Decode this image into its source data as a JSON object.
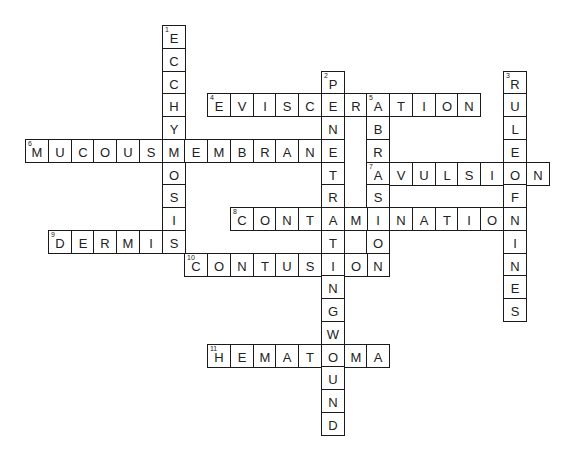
{
  "puzzle": {
    "grid": {
      "origin_x": 25,
      "origin_y": 25,
      "cell_size": 22.75
    },
    "words": [
      {
        "number": 1,
        "answer": "ECCHYMOSIS",
        "direction": "down",
        "row": 0,
        "col": 6
      },
      {
        "number": 2,
        "answer": "PENETRATINGWOUND",
        "direction": "down",
        "row": 2,
        "col": 13
      },
      {
        "number": 3,
        "answer": "RULEOFNINES",
        "direction": "down",
        "row": 2,
        "col": 21
      },
      {
        "number": 4,
        "answer": "EVISCERATION",
        "direction": "across",
        "row": 3,
        "col": 8
      },
      {
        "number": 5,
        "answer": "ABRASION",
        "direction": "down",
        "row": 3,
        "col": 15
      },
      {
        "number": 6,
        "answer": "MUCOUSMEMBRANE",
        "direction": "across",
        "row": 5,
        "col": 0
      },
      {
        "number": 7,
        "answer": "AVULSION",
        "direction": "across",
        "row": 6,
        "col": 15
      },
      {
        "number": 8,
        "answer": "CONTAMINATION",
        "direction": "across",
        "row": 8,
        "col": 9
      },
      {
        "number": 9,
        "answer": "DERMIS",
        "direction": "across",
        "row": 9,
        "col": 1
      },
      {
        "number": 10,
        "answer": "CONTUSION",
        "direction": "across",
        "row": 10,
        "col": 7
      },
      {
        "number": 11,
        "answer": "HEMATOMA",
        "direction": "across",
        "row": 14,
        "col": 8
      }
    ]
  }
}
